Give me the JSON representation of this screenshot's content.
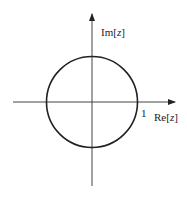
{
  "diagram": {
    "type": "unit-circle-z-plane",
    "imag_axis_label_prefix": "Im[",
    "imag_axis_label_var": "z",
    "imag_axis_label_suffix": "]",
    "real_axis_label_prefix": "Re[",
    "real_axis_label_var": "z",
    "real_axis_label_suffix": "]",
    "unit_marker": "1",
    "colors": {
      "stroke": "#222222",
      "background": "#ffffff"
    }
  }
}
